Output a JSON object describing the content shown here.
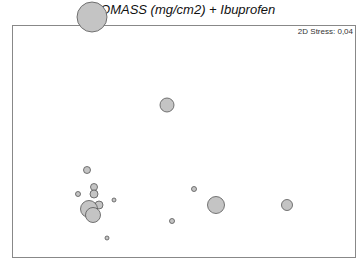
{
  "chart_data": {
    "type": "scatter",
    "subtype": "mds-bubble",
    "title": "BIOMASS (mg/cm2) + Ibuprofen",
    "annotation": "2D Stress: 0,04",
    "xlabel": "",
    "ylabel": "",
    "grid": false,
    "legend": null,
    "frame": {
      "x0": 12,
      "y0": 25,
      "x1": 355,
      "y1": 257
    },
    "colors": {
      "bubble_fill": "#c4c4c4",
      "bubble_stroke": "#555555",
      "frame": "#888888"
    },
    "points": [
      {
        "x": 92,
        "y": 17,
        "r": 15
      },
      {
        "x": 167,
        "y": 105,
        "r": 7
      },
      {
        "x": 87,
        "y": 170,
        "r": 3.5
      },
      {
        "x": 94,
        "y": 187,
        "r": 3.5
      },
      {
        "x": 94,
        "y": 194,
        "r": 4
      },
      {
        "x": 78,
        "y": 194,
        "r": 2.5
      },
      {
        "x": 194,
        "y": 189,
        "r": 2.5
      },
      {
        "x": 114,
        "y": 200,
        "r": 2
      },
      {
        "x": 99,
        "y": 205,
        "r": 4
      },
      {
        "x": 89,
        "y": 209,
        "r": 8.5
      },
      {
        "x": 93,
        "y": 215,
        "r": 7.5
      },
      {
        "x": 216,
        "y": 205,
        "r": 8.5
      },
      {
        "x": 287,
        "y": 205,
        "r": 5.5
      },
      {
        "x": 172,
        "y": 221,
        "r": 2.5
      },
      {
        "x": 107,
        "y": 238,
        "r": 2
      }
    ]
  }
}
